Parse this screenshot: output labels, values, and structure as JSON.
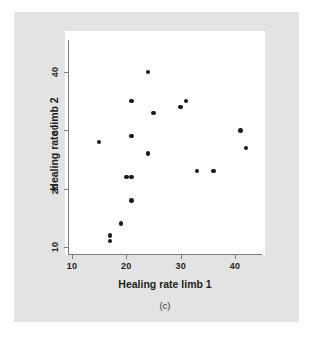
{
  "figure": {
    "caption": "(c)",
    "background_color": "#e3e3e3",
    "plot_background_color": "#ffffff",
    "point_color": "#1b1b1b",
    "axis_color": "#7d7d7d"
  },
  "chart_data": {
    "type": "scatter",
    "title": "",
    "subtitle": "",
    "xlabel": "Healing rate limb 1",
    "ylabel": "Healing rate limb 2",
    "xlim": [
      8,
      45.5
    ],
    "ylim": [
      8.5,
      43
    ],
    "xticks": [
      10,
      20,
      30,
      40
    ],
    "yticks": [
      10,
      20,
      30,
      40
    ],
    "xtick_labels": [
      "10",
      "20",
      "30",
      "40"
    ],
    "ytick_labels": [
      "10",
      "20",
      "30",
      "40"
    ],
    "grid": false,
    "legend": null,
    "annotations": [],
    "series": [
      {
        "name": "limb healing rates",
        "marker": "filled-circle",
        "points": [
          {
            "x": 15,
            "y": 28
          },
          {
            "x": 17,
            "y": 12
          },
          {
            "x": 17,
            "y": 11
          },
          {
            "x": 19,
            "y": 14
          },
          {
            "x": 20,
            "y": 22
          },
          {
            "x": 21,
            "y": 22
          },
          {
            "x": 21,
            "y": 35
          },
          {
            "x": 21,
            "y": 29
          },
          {
            "x": 21,
            "y": 18
          },
          {
            "x": 24,
            "y": 40
          },
          {
            "x": 24,
            "y": 26
          },
          {
            "x": 25,
            "y": 33
          },
          {
            "x": 30,
            "y": 34
          },
          {
            "x": 31,
            "y": 35
          },
          {
            "x": 33,
            "y": 23
          },
          {
            "x": 36,
            "y": 23
          },
          {
            "x": 41,
            "y": 30
          },
          {
            "x": 42,
            "y": 27
          }
        ]
      }
    ]
  }
}
